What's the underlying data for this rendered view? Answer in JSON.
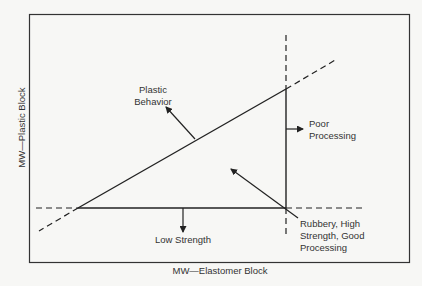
{
  "diagram": {
    "axes": {
      "x_label": "MW—Elastomer Block",
      "y_label": "MW—Plastic Block"
    },
    "regions": [
      {
        "id": "plastic",
        "label": "Plastic\nBehavior"
      },
      {
        "id": "poor-processing",
        "label": "Poor\nProcessing"
      },
      {
        "id": "low-strength",
        "label": "Low Strength"
      },
      {
        "id": "rubbery",
        "label": "Rubbery, High\nStrength, Good\nProcessing"
      }
    ],
    "colors": {
      "line": "#222222",
      "background": "#f7f7f5",
      "text": "#333333"
    }
  }
}
